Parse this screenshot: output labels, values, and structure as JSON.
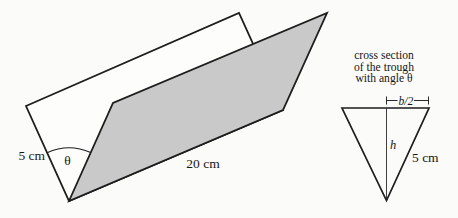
{
  "figure": {
    "colors": {
      "background": "#fbfbf9",
      "line": "#1d1d1d",
      "shade": "#c9c9c9",
      "plank_face": "#fdfdfc"
    },
    "trough": {
      "side_label": "5 cm",
      "angle_label": "θ",
      "length_label": "20 cm"
    },
    "cross_section": {
      "caption": [
        "cross section",
        "of the trough",
        "with angle θ"
      ],
      "half_base_label": "b/2",
      "height_label": "h",
      "side_label": "5 cm"
    }
  }
}
